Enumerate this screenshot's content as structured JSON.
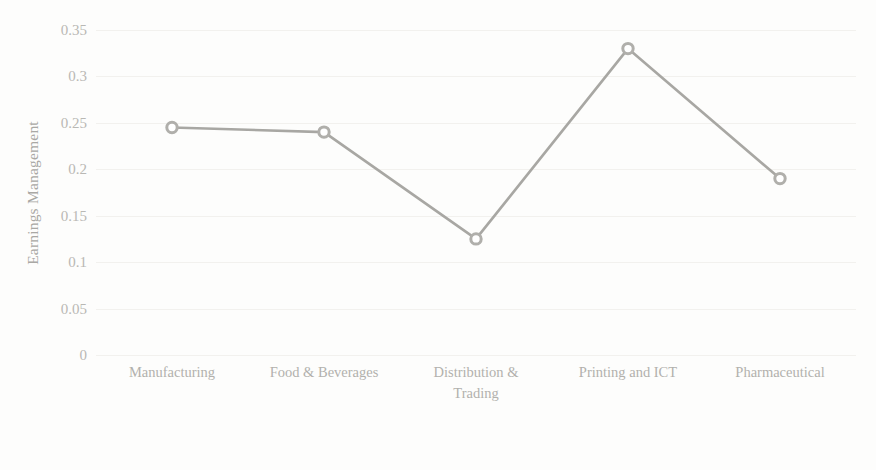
{
  "chart_data": {
    "type": "line",
    "title": "",
    "xlabel": "",
    "ylabel": "Earnings Management",
    "categories": [
      "Manufacturing",
      "Food & Beverages",
      "Distribution &|Trading",
      "Printing and ICT",
      "Pharmaceutical"
    ],
    "values": [
      0.245,
      0.24,
      0.125,
      0.33,
      0.19
    ],
    "series": [
      {
        "name": "Earnings Management",
        "values": [
          0.245,
          0.24,
          0.125,
          0.33,
          0.19
        ]
      }
    ],
    "ylim": [
      0,
      0.35
    ],
    "yticks": [
      0,
      0.05,
      0.1,
      0.15,
      0.2,
      0.25,
      0.3,
      0.35
    ],
    "ytick_labels": [
      "0",
      "0.05",
      "0.1",
      "0.15",
      "0.2",
      "0.25",
      "0.3",
      "0.35"
    ],
    "grid": true,
    "legend": "none",
    "line_color": "#a8a7a3",
    "marker_color": "#b0afab",
    "marker": "circle"
  },
  "axis": {
    "y_title": "Earnings Management",
    "tick_labels": [
      "0.35",
      "0.3",
      "0.25",
      "0.2",
      "0.15",
      "0.1",
      "0.05",
      "0"
    ]
  },
  "x_categories": [
    {
      "line1": "Manufacturing",
      "line2": ""
    },
    {
      "line1": "Food & Beverages",
      "line2": ""
    },
    {
      "line1": "Distribution &",
      "line2": "Trading"
    },
    {
      "line1": "Printing and ICT",
      "line2": ""
    },
    {
      "line1": "Pharmaceutical",
      "line2": ""
    }
  ],
  "scan_artifacts": {
    "top_line_1": "",
    "top_line_2": "",
    "bottom_line": ""
  }
}
